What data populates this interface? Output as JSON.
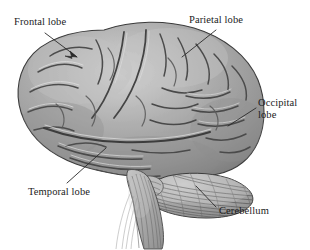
{
  "figure": {
    "background_color": "#ffffff",
    "width": 310,
    "height": 250
  },
  "labels": [
    {
      "id": "frontal",
      "text": "Frontal lobe",
      "leader": "arrow"
    },
    {
      "id": "parietal",
      "text": "Parietal lobe",
      "leader": "line"
    },
    {
      "id": "occipital",
      "text": "Occipital\nlobe",
      "leader": "line"
    },
    {
      "id": "temporal",
      "text": "Temporal lobe",
      "leader": "line"
    },
    {
      "id": "cerebellum",
      "text": "Cerebellum",
      "leader": "line"
    }
  ],
  "structures": [
    {
      "id": "cerebrum",
      "name": "cerebrum"
    },
    {
      "id": "cerebellum",
      "name": "cerebellum"
    },
    {
      "id": "brainstem",
      "name": "brain stem"
    }
  ],
  "colors": {
    "ink": "#1c1c1c",
    "leader_line": "#2a2a2a",
    "cortex_light": "#c9c9c9",
    "cortex_mid": "#a2a2a2",
    "cortex_dark": "#6f6f6f",
    "sulcus": "#4a4a4a",
    "outline": "#3a3a3a",
    "cerebellum_fill": "#b4b4b4",
    "brainstem_fill": "#bdbdbd"
  }
}
